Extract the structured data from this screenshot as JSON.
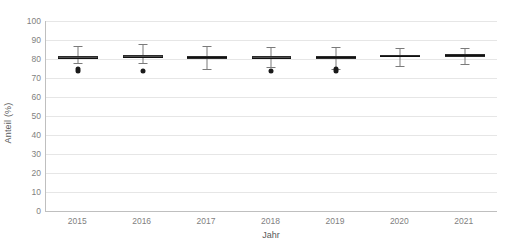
{
  "chart_data": {
    "type": "box",
    "title": "",
    "xlabel": "Jahr",
    "ylabel": "Anteil (%)",
    "ylim": [
      0,
      100
    ],
    "yticks": [
      0,
      10,
      20,
      30,
      40,
      50,
      60,
      70,
      80,
      90,
      100
    ],
    "grid": true,
    "legend": "none",
    "categories": [
      "2015",
      "2016",
      "2017",
      "2018",
      "2019",
      "2020",
      "2021"
    ],
    "boxes": [
      {
        "category": "2015",
        "whisker_low": 78.0,
        "q1": 80.0,
        "median": 80.7,
        "q3": 81.6,
        "whisker_high": 87.0,
        "outliers": [
          73.5,
          74.5
        ]
      },
      {
        "category": "2016",
        "whisker_low": 78.0,
        "q1": 80.3,
        "median": 81.0,
        "q3": 82.0,
        "whisker_high": 88.0,
        "outliers": [
          73.5
        ]
      },
      {
        "category": "2017",
        "whisker_low": 74.5,
        "q1": 80.0,
        "median": 80.8,
        "q3": 81.8,
        "whisker_high": 87.0,
        "outliers": []
      },
      {
        "category": "2018",
        "whisker_low": 76.0,
        "q1": 80.0,
        "median": 80.7,
        "q3": 81.5,
        "whisker_high": 86.5,
        "outliers": [
          73.8
        ]
      },
      {
        "category": "2019",
        "whisker_low": 75.0,
        "q1": 80.2,
        "median": 81.0,
        "q3": 81.8,
        "whisker_high": 86.5,
        "outliers": [
          73.5,
          74.5
        ]
      },
      {
        "category": "2020",
        "whisker_low": 76.5,
        "q1": 80.8,
        "median": 81.5,
        "q3": 82.2,
        "whisker_high": 86.0,
        "outliers": []
      },
      {
        "category": "2021",
        "whisker_low": 77.5,
        "q1": 81.2,
        "median": 82.0,
        "q3": 82.8,
        "whisker_high": 86.0,
        "outliers": []
      }
    ],
    "colors": {
      "box_fill": "#4d4d4d",
      "box_edge": "#2b2b2b",
      "whisker": "#7a7a7a",
      "outlier": "#1a1a1a",
      "gridline": "#e6e6e6",
      "axis": "#bfbfbf",
      "text": "#7f7f7f",
      "background": "#ffffff"
    }
  }
}
